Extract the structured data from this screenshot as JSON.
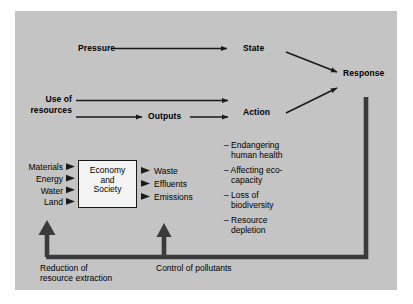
{
  "figure": {
    "panel_color": "#c4c4c4",
    "line_color": "#1a1a1a",
    "box_fill": "#f4f4f4"
  },
  "top_flow": {
    "pressure_label": "Pressure",
    "state_label": "State",
    "response_label": "Response"
  },
  "middle_flow": {
    "use_line1": "Use of",
    "use_line2": "resources",
    "outputs_label": "Outputs",
    "action_label": "Action"
  },
  "system": {
    "box_line1": "Economy",
    "box_line2": "and",
    "box_line3": "Society",
    "inputs": [
      "Materials",
      "Energy",
      "Water",
      "Land"
    ],
    "outputs": [
      "Waste",
      "Effluents",
      "Emissions"
    ]
  },
  "impacts": {
    "items": [
      {
        "line1": "– Endangering",
        "line2": "human health"
      },
      {
        "line1": "– Affecting eco-",
        "line2": "capacity"
      },
      {
        "line1": "– Loss of",
        "line2": "biodiversity"
      },
      {
        "line1": "– Resource",
        "line2": "depletion"
      }
    ]
  },
  "feedback": {
    "left_label_line1": "Reduction of",
    "left_label_line2": "resource extraction",
    "right_label": "Control of pollutants"
  }
}
